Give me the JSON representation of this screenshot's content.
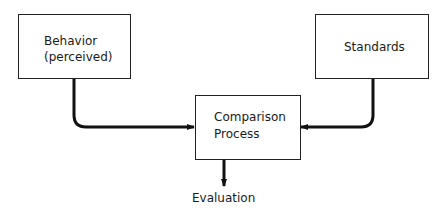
{
  "diagram": {
    "nodes": {
      "behavior": {
        "line1": "Behavior",
        "line2": "(perceived)"
      },
      "standards": {
        "label": "Standards"
      },
      "comparison": {
        "line1": "Comparison",
        "line2": "Process"
      },
      "evaluation": {
        "label": "Evaluation"
      }
    },
    "edges": [
      {
        "from": "behavior",
        "to": "comparison"
      },
      {
        "from": "standards",
        "to": "comparison"
      },
      {
        "from": "comparison",
        "to": "evaluation"
      }
    ],
    "colors": {
      "line": "#111111",
      "box_border": "#222222",
      "background": "#ffffff"
    }
  }
}
